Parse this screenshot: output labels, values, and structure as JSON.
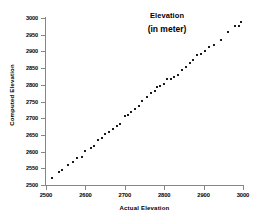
{
  "chart_data": {
    "type": "scatter",
    "title": "Elevation",
    "subtitle": "(in meter)",
    "xlabel": "Actual Elevation",
    "ylabel": "Computed Elevation",
    "xlim": [
      2500,
      3000
    ],
    "ylim": [
      2500,
      3000
    ],
    "xticks": [
      2500,
      2600,
      2700,
      2800,
      2900,
      3000
    ],
    "yticks": [
      2500,
      2550,
      2600,
      2650,
      2700,
      2750,
      2800,
      2850,
      2900,
      2950,
      3000
    ],
    "grid": false,
    "legend": false,
    "marker_color": "#1a1a1a",
    "axis_color": "#868686",
    "series": [
      {
        "name": "Elevation points",
        "x": [
          2515,
          2533,
          2541,
          2556,
          2568,
          2578,
          2592,
          2600,
          2613,
          2622,
          2633,
          2641,
          2650,
          2661,
          2670,
          2679,
          2688,
          2700,
          2708,
          2717,
          2726,
          2735,
          2744,
          2756,
          2766,
          2777,
          2782,
          2790,
          2799,
          2808,
          2818,
          2826,
          2836,
          2846,
          2855,
          2865,
          2874,
          2884,
          2893,
          2903,
          2913,
          2927,
          2943,
          2961,
          2980,
          2990
        ],
        "y": [
          2521,
          2538,
          2545,
          2560,
          2570,
          2581,
          2584,
          2601,
          2612,
          2616,
          2635,
          2641,
          2654,
          2660,
          2667,
          2678,
          2682,
          2706,
          2710,
          2718,
          2727,
          2737,
          2751,
          2762,
          2775,
          2780,
          2794,
          2797,
          2803,
          2818,
          2818,
          2822,
          2830,
          2845,
          2852,
          2864,
          2873,
          2889,
          2891,
          2901,
          2914,
          2920,
          2933,
          2958,
          2976,
          2977
        ],
        "marker": "square"
      },
      {
        "name": "Elevation points extra",
        "x": [
          2995
        ],
        "y": [
          2988
        ],
        "marker": "square"
      }
    ]
  }
}
